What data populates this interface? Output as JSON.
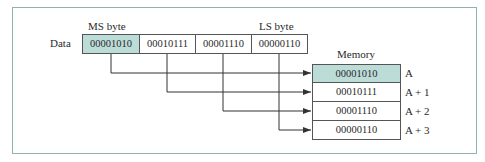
{
  "labels": {
    "ms_byte": "MS byte",
    "ls_byte": "LS byte",
    "data": "Data",
    "memory": "Memory"
  },
  "data_bytes": [
    "00001010",
    "00010111",
    "00001110",
    "00000110"
  ],
  "memory": [
    {
      "value": "00001010",
      "address": "A"
    },
    {
      "value": "00010111",
      "address": "A + 1"
    },
    {
      "value": "00001110",
      "address": "A + 2"
    },
    {
      "value": "00000110",
      "address": "A + 3"
    }
  ],
  "colors": {
    "highlight": "#bcdcd8",
    "frame": "#8fb3b0",
    "line": "#333333"
  }
}
